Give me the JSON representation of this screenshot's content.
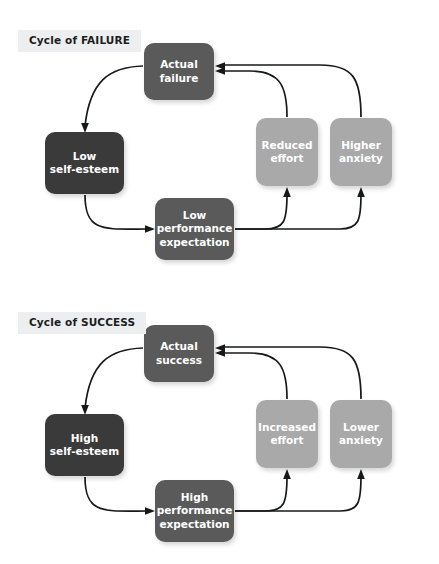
{
  "diagram": {
    "title_failure": "Cycle of FAILURE",
    "title_success": "Cycle of SUCCESS",
    "colors": {
      "dark_node": "#3a3a3a",
      "mid_node": "#5a5a5a",
      "light_node": "#a9a9a9",
      "title_background": "#eceeef",
      "title_text": "#1d1d1d",
      "node_text": "#ffffff",
      "arrow": "#17181a",
      "page_background": "#ffffff"
    }
  },
  "cycles": [
    {
      "id": "failure",
      "title": "Cycle of FAILURE",
      "nodes": {
        "actual": "Actual\nfailure",
        "esteem": "Low\nself-esteem",
        "effort": "Reduced\neffort",
        "anxiety": "Higher\nanxiety",
        "expectation": "Low\nperformance\nexpectation"
      },
      "edges": [
        {
          "from": "actual",
          "to": "esteem"
        },
        {
          "from": "esteem",
          "to": "expectation"
        },
        {
          "from": "expectation",
          "to": "effort"
        },
        {
          "from": "expectation",
          "to": "anxiety"
        },
        {
          "from": "effort",
          "to": "actual"
        },
        {
          "from": "anxiety",
          "to": "actual"
        }
      ]
    },
    {
      "id": "success",
      "title": "Cycle of SUCCESS",
      "nodes": {
        "actual": "Actual\nsuccess",
        "esteem": "High\nself-esteem",
        "effort": "Increased\neffort",
        "anxiety": "Lower\nanxiety",
        "expectation": "High\nperformance\nexpectation"
      },
      "edges": [
        {
          "from": "actual",
          "to": "esteem"
        },
        {
          "from": "esteem",
          "to": "expectation"
        },
        {
          "from": "expectation",
          "to": "effort"
        },
        {
          "from": "expectation",
          "to": "anxiety"
        },
        {
          "from": "effort",
          "to": "actual"
        },
        {
          "from": "anxiety",
          "to": "actual"
        }
      ]
    }
  ]
}
